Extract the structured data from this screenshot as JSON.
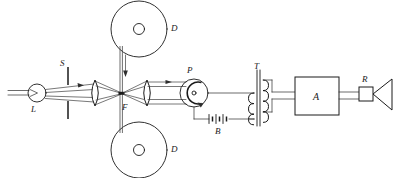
{
  "figure": {
    "type": "schematic-diagram",
    "background_color": "#ffffff",
    "line_color": "#1a1a1a",
    "width": 400,
    "height": 178
  },
  "labels": {
    "lamp": "L",
    "slit": "S",
    "focus": "F",
    "reel_top": "D",
    "reel_bottom": "D",
    "photocell": "P",
    "battery": "B",
    "transformer": "T",
    "amplifier": "A",
    "resistor": "R"
  },
  "components": [
    {
      "id": "lamp",
      "name": "exciter-lamp",
      "label": "L",
      "shape": "circle-with-filament"
    },
    {
      "id": "slit",
      "name": "slit-aperture",
      "label": "S",
      "shape": "two-vertical-bars"
    },
    {
      "id": "lens-1",
      "name": "condenser-lens",
      "label": "",
      "shape": "biconvex-lens"
    },
    {
      "id": "film",
      "name": "film-strip",
      "label": "",
      "shape": "vertical-strip"
    },
    {
      "id": "focus",
      "name": "focal-point",
      "label": "F",
      "shape": "point"
    },
    {
      "id": "lens-2",
      "name": "objective-lens",
      "label": "",
      "shape": "biconvex-lens"
    },
    {
      "id": "reel-top",
      "name": "film-reel-top",
      "label": "D",
      "shape": "circle-with-hub"
    },
    {
      "id": "reel-bottom",
      "name": "film-reel-bottom",
      "label": "D",
      "shape": "circle-with-hub"
    },
    {
      "id": "photocell",
      "name": "photocell",
      "label": "P",
      "shape": "circle-with-c-cathode"
    },
    {
      "id": "battery",
      "name": "battery",
      "label": "B",
      "shape": "three-cell-battery"
    },
    {
      "id": "transformer",
      "name": "transformer",
      "label": "T",
      "shape": "coupled-coils-with-core"
    },
    {
      "id": "amplifier",
      "name": "amplifier",
      "label": "A",
      "shape": "rectangle"
    },
    {
      "id": "resistor",
      "name": "resistor",
      "label": "R",
      "shape": "small-square"
    },
    {
      "id": "speaker",
      "name": "loudspeaker-horn",
      "label": "",
      "shape": "triangle-horn"
    }
  ],
  "annotations": {
    "ray_direction_1": "right-arrow on upper ray after slit",
    "ray_direction_2": "right-arrow on ray after second lens",
    "film_travel": "down-arrow on film strip",
    "photocell_rotation": "curved arrow inside photocell"
  }
}
